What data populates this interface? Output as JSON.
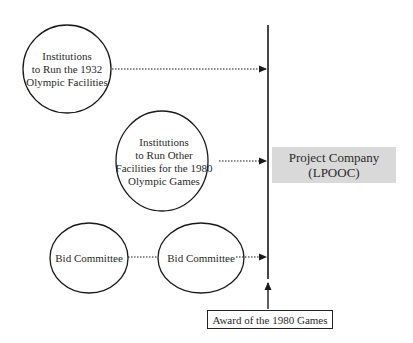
{
  "diagram": {
    "nodes": {
      "institutions_1932": {
        "lines": [
          "Institutions",
          "to Run the 1932",
          "Olympic Facilities"
        ]
      },
      "institutions_1980": {
        "lines": [
          "Institutions",
          "to Run Other",
          "Facilities for the 1980",
          "Olympic Games"
        ]
      },
      "bid_committee_1": {
        "label": "Bid Committee"
      },
      "bid_committee_2": {
        "label": "Bid Committee"
      },
      "project_company": {
        "lines": [
          "Project Company",
          "(LPOOC)"
        ]
      },
      "award": {
        "label": "Award of the 1980 Games"
      }
    },
    "edges": [
      {
        "from": "institutions_1932",
        "to": "timeline",
        "style": "dotted-arrow"
      },
      {
        "from": "institutions_1980",
        "to": "timeline",
        "style": "dotted-arrow"
      },
      {
        "from": "bid_committee_1",
        "to": "bid_committee_2",
        "style": "dotted"
      },
      {
        "from": "bid_committee_2",
        "to": "timeline",
        "style": "dotted-arrow"
      },
      {
        "from": "award",
        "to": "timeline",
        "style": "solid-arrow"
      }
    ],
    "colors": {
      "line": "#1a1a1a",
      "project_fill": "#d9d9d9"
    }
  }
}
